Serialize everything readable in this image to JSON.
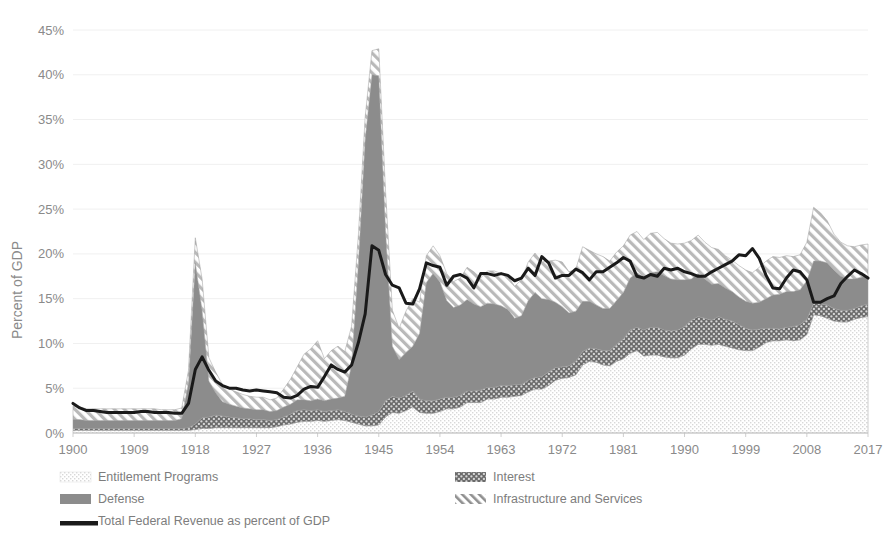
{
  "chart_data": {
    "type": "area",
    "stacked": true,
    "title": "",
    "xlabel": "",
    "ylabel": "Percent of GDP",
    "ylim": [
      0,
      45
    ],
    "xlim": [
      1900,
      2017
    ],
    "y_ticks": [
      "0%",
      "5%",
      "10%",
      "15%",
      "20%",
      "25%",
      "30%",
      "35%",
      "40%",
      "45%"
    ],
    "y_tick_values": [
      0,
      5,
      10,
      15,
      20,
      25,
      30,
      35,
      40,
      45
    ],
    "x_ticks": [
      "1900",
      "1909",
      "1918",
      "1927",
      "1936",
      "1945",
      "1954",
      "1963",
      "1972",
      "1981",
      "1990",
      "1999",
      "2008",
      "2017"
    ],
    "x_tick_values": [
      1900,
      1909,
      1918,
      1927,
      1936,
      1945,
      1954,
      1963,
      1972,
      1981,
      1990,
      1999,
      2008,
      2017
    ],
    "grid": true,
    "legend_position": "bottom",
    "legend": [
      {
        "label": "Entitlement Programs",
        "marker": "light-dotted-swatch"
      },
      {
        "label": "Interest",
        "marker": "dark-dotted-swatch"
      },
      {
        "label": "Defense",
        "marker": "gray-solid-swatch"
      },
      {
        "label": "Infrastructure and Services",
        "marker": "diagonal-hatch-swatch"
      },
      {
        "label": "Total Federal Revenue as percent of GDP",
        "marker": "black-line-swatch"
      }
    ],
    "x": [
      1900,
      1901,
      1902,
      1903,
      1904,
      1905,
      1906,
      1907,
      1908,
      1909,
      1910,
      1911,
      1912,
      1913,
      1914,
      1915,
      1916,
      1917,
      1918,
      1919,
      1920,
      1921,
      1922,
      1923,
      1924,
      1925,
      1926,
      1927,
      1928,
      1929,
      1930,
      1931,
      1932,
      1933,
      1934,
      1935,
      1936,
      1937,
      1938,
      1939,
      1940,
      1941,
      1942,
      1943,
      1944,
      1945,
      1946,
      1947,
      1948,
      1949,
      1950,
      1951,
      1952,
      1953,
      1954,
      1955,
      1956,
      1957,
      1958,
      1959,
      1960,
      1961,
      1962,
      1963,
      1964,
      1965,
      1966,
      1967,
      1968,
      1969,
      1970,
      1971,
      1972,
      1973,
      1974,
      1975,
      1976,
      1977,
      1978,
      1979,
      1980,
      1981,
      1982,
      1983,
      1984,
      1985,
      1986,
      1987,
      1988,
      1989,
      1990,
      1991,
      1992,
      1993,
      1994,
      1995,
      1996,
      1997,
      1998,
      1999,
      2000,
      2001,
      2002,
      2003,
      2004,
      2005,
      2006,
      2007,
      2008,
      2009,
      2010,
      2011,
      2012,
      2013,
      2014,
      2015,
      2016,
      2017
    ],
    "series": [
      {
        "name": "Entitlement Programs",
        "values": [
          0.3,
          0.3,
          0.3,
          0.3,
          0.3,
          0.3,
          0.3,
          0.3,
          0.3,
          0.3,
          0.3,
          0.3,
          0.3,
          0.3,
          0.3,
          0.3,
          0.3,
          0.3,
          0.4,
          0.5,
          0.5,
          0.6,
          0.6,
          0.6,
          0.6,
          0.6,
          0.6,
          0.6,
          0.6,
          0.6,
          0.7,
          0.9,
          1.0,
          1.2,
          1.3,
          1.3,
          1.4,
          1.3,
          1.4,
          1.5,
          1.4,
          1.2,
          1.0,
          0.8,
          0.8,
          0.9,
          1.8,
          2.3,
          2.2,
          2.5,
          2.9,
          2.3,
          2.2,
          2.2,
          2.4,
          2.7,
          2.7,
          2.9,
          3.4,
          3.4,
          3.4,
          3.8,
          3.8,
          4.0,
          4.0,
          4.1,
          4.2,
          4.6,
          4.9,
          4.9,
          5.3,
          5.9,
          6.1,
          6.2,
          6.5,
          7.6,
          8.0,
          7.9,
          7.6,
          7.5,
          8.0,
          8.3,
          8.9,
          9.2,
          8.6,
          8.7,
          8.7,
          8.5,
          8.4,
          8.4,
          8.7,
          9.4,
          9.9,
          9.9,
          9.8,
          9.9,
          9.7,
          9.5,
          9.3,
          9.2,
          9.2,
          9.6,
          10.1,
          10.3,
          10.3,
          10.4,
          10.3,
          10.4,
          11.0,
          13.2,
          13.1,
          12.8,
          12.5,
          12.4,
          12.4,
          12.7,
          12.9,
          13.0
        ]
      },
      {
        "name": "Interest",
        "values": [
          0.2,
          0.2,
          0.2,
          0.2,
          0.2,
          0.2,
          0.2,
          0.2,
          0.2,
          0.2,
          0.2,
          0.2,
          0.2,
          0.2,
          0.2,
          0.2,
          0.2,
          0.3,
          0.6,
          1.2,
          1.3,
          1.4,
          1.3,
          1.2,
          1.1,
          1.0,
          1.0,
          0.9,
          0.9,
          0.8,
          0.8,
          0.9,
          1.1,
          1.3,
          1.3,
          1.2,
          1.2,
          1.1,
          1.1,
          1.1,
          1.0,
          0.9,
          0.9,
          1.0,
          1.2,
          1.5,
          1.8,
          1.8,
          1.7,
          1.7,
          1.8,
          1.5,
          1.4,
          1.4,
          1.4,
          1.3,
          1.3,
          1.3,
          1.3,
          1.3,
          1.4,
          1.3,
          1.3,
          1.3,
          1.3,
          1.3,
          1.2,
          1.3,
          1.3,
          1.4,
          1.5,
          1.4,
          1.3,
          1.3,
          1.5,
          1.5,
          1.5,
          1.5,
          1.6,
          1.7,
          1.9,
          2.2,
          2.6,
          2.6,
          2.9,
          3.1,
          3.1,
          3.0,
          3.0,
          3.1,
          3.2,
          3.2,
          3.1,
          2.9,
          2.8,
          3.1,
          3.0,
          3.0,
          2.8,
          2.5,
          2.3,
          2.0,
          1.6,
          1.4,
          1.3,
          1.4,
          1.6,
          1.7,
          1.7,
          1.3,
          1.3,
          1.5,
          1.4,
          1.3,
          1.3,
          1.2,
          1.3,
          1.4
        ]
      },
      {
        "name": "Defense",
        "values": [
          1.0,
          1.0,
          0.9,
          0.9,
          0.9,
          0.9,
          0.9,
          0.9,
          0.9,
          0.9,
          0.9,
          0.9,
          0.9,
          0.9,
          0.9,
          0.9,
          1.1,
          5.0,
          18.0,
          12.0,
          4.0,
          2.5,
          1.6,
          1.4,
          1.3,
          1.2,
          1.1,
          1.1,
          1.1,
          1.0,
          1.0,
          1.1,
          1.1,
          1.2,
          1.1,
          1.1,
          1.2,
          1.2,
          1.3,
          1.3,
          1.7,
          5.5,
          17.0,
          31.0,
          38.0,
          37.5,
          19.0,
          5.6,
          4.3,
          4.8,
          5.0,
          7.3,
          13.2,
          14.2,
          13.1,
          10.8,
          10.0,
          10.1,
          10.2,
          9.7,
          9.3,
          9.4,
          9.3,
          8.9,
          8.5,
          7.4,
          7.7,
          8.9,
          9.5,
          8.7,
          8.1,
          7.3,
          6.7,
          5.9,
          5.6,
          5.6,
          5.2,
          4.9,
          4.7,
          4.7,
          4.9,
          5.2,
          5.8,
          6.1,
          5.9,
          6.1,
          6.2,
          6.1,
          5.8,
          5.6,
          5.2,
          4.6,
          4.8,
          4.4,
          4.0,
          3.7,
          3.5,
          3.3,
          3.1,
          3.0,
          3.0,
          3.0,
          3.3,
          3.7,
          3.9,
          4.0,
          3.9,
          3.9,
          4.3,
          4.7,
          4.8,
          4.7,
          4.3,
          3.8,
          3.5,
          3.3,
          3.2,
          3.1
        ]
      },
      {
        "name": "Infrastructure and Services",
        "values": [
          1.5,
          1.4,
          1.3,
          1.3,
          1.3,
          1.3,
          1.3,
          1.3,
          1.3,
          1.3,
          1.3,
          1.3,
          1.3,
          1.2,
          1.2,
          1.2,
          1.2,
          1.4,
          2.8,
          3.5,
          2.6,
          2.3,
          1.9,
          1.7,
          1.6,
          1.5,
          1.4,
          1.4,
          1.4,
          1.3,
          1.4,
          2.0,
          2.8,
          3.7,
          5.1,
          5.8,
          6.5,
          4.7,
          5.4,
          5.8,
          5.0,
          4.3,
          3.2,
          2.5,
          2.7,
          3.0,
          4.4,
          4.0,
          3.5,
          4.6,
          5.3,
          3.5,
          3.0,
          3.1,
          2.9,
          3.0,
          2.9,
          3.0,
          3.6,
          3.6,
          3.2,
          3.6,
          3.7,
          3.6,
          3.7,
          3.6,
          4.0,
          4.3,
          4.4,
          4.1,
          4.3,
          4.7,
          5.0,
          4.6,
          4.7,
          6.1,
          5.7,
          5.7,
          5.8,
          5.3,
          5.4,
          5.2,
          4.8,
          4.6,
          4.2,
          4.4,
          4.4,
          4.1,
          4.0,
          4.0,
          4.1,
          4.3,
          4.3,
          4.1,
          4.1,
          3.8,
          3.6,
          3.5,
          3.5,
          3.5,
          3.4,
          3.9,
          4.2,
          4.3,
          4.1,
          4.0,
          3.9,
          3.9,
          4.3,
          6.0,
          5.4,
          4.7,
          4.0,
          3.8,
          3.7,
          3.6,
          3.6,
          3.6
        ]
      }
    ],
    "line_series": {
      "name": "Total Federal Revenue as percent of GDP",
      "values": [
        3.3,
        2.8,
        2.5,
        2.5,
        2.4,
        2.3,
        2.3,
        2.3,
        2.3,
        2.3,
        2.4,
        2.4,
        2.3,
        2.3,
        2.3,
        2.2,
        2.2,
        3.3,
        7.1,
        8.5,
        7.0,
        5.8,
        5.3,
        5.0,
        5.0,
        4.8,
        4.7,
        4.8,
        4.7,
        4.6,
        4.5,
        4.0,
        3.9,
        4.2,
        4.9,
        5.2,
        5.1,
        6.3,
        7.6,
        7.1,
        6.8,
        7.6,
        10.1,
        13.3,
        20.9,
        20.4,
        17.7,
        16.5,
        16.2,
        14.5,
        14.4,
        16.1,
        19.0,
        18.7,
        18.5,
        16.5,
        17.5,
        17.7,
        17.3,
        16.2,
        17.8,
        17.8,
        17.6,
        17.8,
        17.6,
        17.0,
        17.3,
        18.4,
        17.6,
        19.7,
        19.0,
        17.3,
        17.6,
        17.6,
        18.3,
        17.9,
        17.1,
        18.0,
        18.0,
        18.5,
        19.0,
        19.6,
        19.2,
        17.5,
        17.3,
        17.7,
        17.5,
        18.4,
        18.2,
        18.4,
        18.0,
        17.8,
        17.5,
        17.5,
        18.0,
        18.4,
        18.8,
        19.2,
        19.9,
        19.8,
        20.6,
        19.5,
        17.6,
        16.2,
        16.1,
        17.3,
        18.2,
        18.0,
        17.1,
        14.6,
        14.6,
        15.0,
        15.3,
        16.7,
        17.5,
        18.2,
        17.8,
        17.3
      ]
    }
  },
  "colors": {
    "entitlement": "#f0f0f0",
    "interest": "#6e6e6e",
    "defense": "#8a8a8a",
    "infrastructure": "#ffffff",
    "revenue_line": "#1a1a1a",
    "grid": "#f0f0f0",
    "text": "#8a8a8a",
    "background": "#ffffff"
  }
}
